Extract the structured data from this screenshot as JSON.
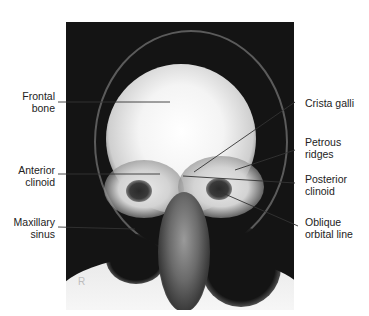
{
  "figure": {
    "image_description": "PA skull radiograph (Caldwell projection)",
    "side_marker": "R"
  },
  "labels": {
    "left": [
      {
        "line1": "Frontal",
        "line2": "bone"
      },
      {
        "line1": "Anterior",
        "line2": "clinoid"
      },
      {
        "line1": "Maxillary",
        "line2": "sinus"
      }
    ],
    "right": [
      {
        "line1": "Crista galli",
        "line2": ""
      },
      {
        "line1": "Petrous",
        "line2": "ridges"
      },
      {
        "line1": "Posterior",
        "line2": "clinoid"
      },
      {
        "line1": "Oblique",
        "line2": "orbital line"
      }
    ]
  }
}
